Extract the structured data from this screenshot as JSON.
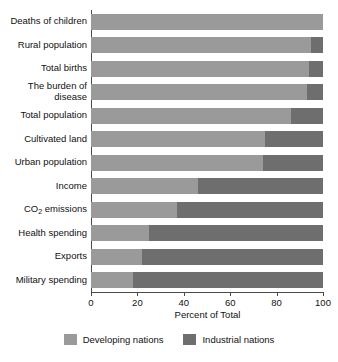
{
  "chart_data": {
    "type": "bar",
    "orientation": "horizontal",
    "stacked": true,
    "title": "",
    "xlabel": "Percent of Total",
    "ylabel": "",
    "xlim": [
      0,
      100
    ],
    "xticks": [
      0,
      20,
      40,
      60,
      80,
      100
    ],
    "grid": false,
    "legend_position": "bottom",
    "categories": [
      "Deaths of children",
      "Rural population",
      "Total births",
      "The burden of disease",
      "Total population",
      "Cultivated land",
      "Urban population",
      "Income",
      "CO2 emissions",
      "Health spending",
      "Exports",
      "Military spending"
    ],
    "series": [
      {
        "name": "Developing nations",
        "color": "#9a9a9a",
        "values": [
          100,
          95,
          94,
          93,
          86,
          75,
          74,
          46,
          37,
          25,
          22,
          18
        ]
      },
      {
        "name": "Industrial nations",
        "color": "#6e6e6e",
        "values": [
          0,
          5,
          6,
          7,
          14,
          25,
          26,
          54,
          63,
          75,
          78,
          82
        ]
      }
    ]
  },
  "axis": {
    "x_title": "Percent of Total",
    "x_tick_labels": [
      "0",
      "20",
      "40",
      "60",
      "80",
      "100"
    ],
    "y_tick_labels": [
      {
        "text": "Deaths of children",
        "subscript": false
      },
      {
        "text": "Rural population",
        "subscript": false
      },
      {
        "text": "Total births",
        "subscript": false
      },
      {
        "text": "The burden of disease",
        "subscript": false
      },
      {
        "text": "Total population",
        "subscript": false
      },
      {
        "text": "Cultivated land",
        "subscript": false
      },
      {
        "text": "Urban population",
        "subscript": false
      },
      {
        "text": "Income",
        "subscript": false
      },
      {
        "text": "CO2 emissions",
        "subscript": true
      },
      {
        "text": "Health spending",
        "subscript": false
      },
      {
        "text": "Exports",
        "subscript": false
      },
      {
        "text": "Military spending",
        "subscript": false
      }
    ]
  },
  "legend": {
    "items": [
      {
        "label": "Developing nations",
        "color": "#9a9a9a"
      },
      {
        "label": "Industrial nations",
        "color": "#6e6e6e"
      }
    ]
  },
  "colors": {
    "developing": "#9a9a9a",
    "industrial": "#6e6e6e",
    "axis": "#4a4a4a",
    "text": "#111111",
    "background": "#ffffff"
  }
}
